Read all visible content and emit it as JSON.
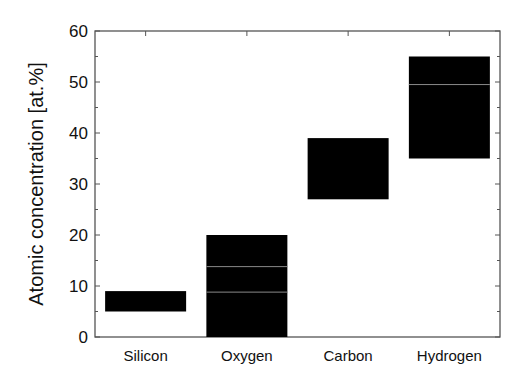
{
  "chart_data": {
    "type": "bar",
    "subtype": "floating-range",
    "title": "",
    "xlabel": "",
    "ylabel": "Atomic concentration [at.%]",
    "ylim": [
      0,
      60
    ],
    "yticks": [
      0,
      10,
      20,
      30,
      40,
      50,
      60
    ],
    "grid": false,
    "legend": null,
    "categories": [
      "Silicon",
      "Oxygen",
      "Carbon",
      "Hydrogen"
    ],
    "series": [
      {
        "name": "Atomic concentration range",
        "ranges": [
          {
            "category": "Silicon",
            "low": 5,
            "high": 9,
            "inner_lines": []
          },
          {
            "category": "Oxygen",
            "low": 0,
            "high": 20,
            "inner_lines": [
              8.8,
              13.8
            ]
          },
          {
            "category": "Carbon",
            "low": 27,
            "high": 39,
            "inner_lines": []
          },
          {
            "category": "Hydrogen",
            "low": 35,
            "high": 55,
            "inner_lines": [
              49.5
            ]
          }
        ]
      }
    ],
    "colors": {
      "bar": "#000000",
      "inner_line": "#8a8a8a",
      "axis": "#555555"
    }
  }
}
